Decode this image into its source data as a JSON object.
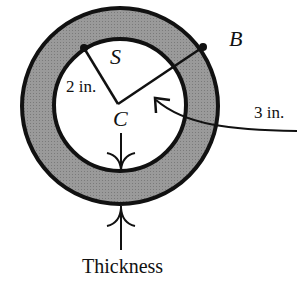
{
  "diagram": {
    "labels": {
      "point_s": "S",
      "point_b": "B",
      "center": "C",
      "inner_radius": "2 in.",
      "outer_radius": "3 in.",
      "thickness": "Thickness"
    },
    "colors": {
      "ring_fill": "#8f8f8f",
      "stroke": "#111111",
      "background": "#ffffff"
    },
    "geometry": {
      "inner_radius_in": 2,
      "outer_radius_in": 3
    }
  }
}
